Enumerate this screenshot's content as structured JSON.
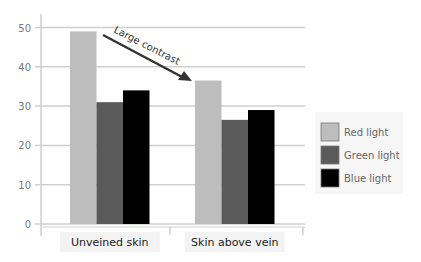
{
  "chart_data": {
    "type": "bar",
    "title": "",
    "xlabel": "",
    "ylabel": "",
    "categories": [
      "Unveined skin",
      "Skin above vein"
    ],
    "series": [
      {
        "name": "Red light",
        "color": "#bdbdbd",
        "values": [
          49,
          36.5
        ]
      },
      {
        "name": "Green light",
        "color": "#5a5a5a",
        "values": [
          31,
          26.5
        ]
      },
      {
        "name": "Blue light",
        "color": "#000000",
        "values": [
          34,
          29
        ]
      }
    ],
    "ylim": [
      0,
      52
    ],
    "yticks": [
      0,
      10,
      20,
      30,
      40,
      50
    ],
    "grid": true,
    "legend_position": "right",
    "annotations": [
      {
        "text": "Large contrast",
        "type": "arrow",
        "from": "Unveined skin red",
        "to": "Skin above vein red"
      }
    ]
  }
}
